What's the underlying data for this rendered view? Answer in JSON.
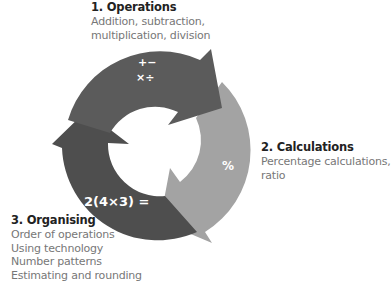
{
  "colors": {
    "operations_arrow": "#5b5b5b",
    "calculations_arrow": "#a3a3a3",
    "organising_arrow": "#4e4e4e"
  },
  "steps": [
    {
      "title": "1. Operations",
      "description": [
        "Addition, subtraction,",
        "multiplication, division"
      ],
      "symbols": [
        "+−",
        "×÷"
      ]
    },
    {
      "title": "2. Calculations",
      "description": [
        "Percentage calculations,",
        "ratio"
      ],
      "symbols": [
        "%"
      ]
    },
    {
      "title": "3. Organising",
      "description": [
        "Order of operations",
        "Using technology",
        "Number patterns",
        "Estimating and rounding"
      ],
      "symbols": [
        "2(4×3) ="
      ]
    }
  ]
}
